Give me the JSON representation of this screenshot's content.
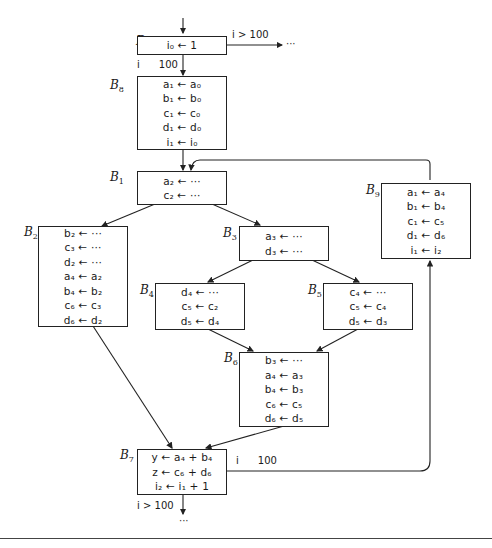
{
  "blocks": {
    "B0": {
      "label": "B",
      "sub": "0",
      "stmts": [
        "i₀ ← 1"
      ]
    },
    "B8": {
      "label": "B",
      "sub": "8",
      "stmts": [
        "a₁ ← a₀",
        "b₁ ← b₀",
        "c₁ ← c₀",
        "d₁ ← d₀",
        "i₁ ← i₀"
      ]
    },
    "B1": {
      "label": "B",
      "sub": "1",
      "stmts": [
        "a₂ ← ···",
        "c₂ ← ···"
      ]
    },
    "B2": {
      "label": "B",
      "sub": "2",
      "stmts": [
        "b₂ ← ···",
        "c₃ ← ···",
        "d₂ ← ···",
        "a₄ ← a₂",
        "b₄ ← b₂",
        "c₆ ← c₃",
        "d₆ ← d₂"
      ]
    },
    "B3": {
      "label": "B",
      "sub": "3",
      "stmts": [
        "a₃ ← ···",
        "d₃ ← ···"
      ]
    },
    "B4": {
      "label": "B",
      "sub": "4",
      "stmts": [
        "d₄ ← ···",
        "c₅ ← c₂",
        "d₅ ← d₄"
      ]
    },
    "B5": {
      "label": "B",
      "sub": "5",
      "stmts": [
        "c₄ ← ···",
        "c₅ ← c₄",
        "d₅ ← d₃"
      ]
    },
    "B6": {
      "label": "B",
      "sub": "6",
      "stmts": [
        "b₃ ← ···",
        "a₄ ← a₃",
        "b₄ ← b₃",
        "c₆ ← c₅",
        "d₆ ← d₅"
      ]
    },
    "B7": {
      "label": "B",
      "sub": "7",
      "stmts": [
        "y ← a₄ + b₄",
        "z ← c₆ + d₆",
        "i₂ ← i₁ + 1"
      ]
    },
    "B9": {
      "label": "B",
      "sub": "9",
      "stmts": [
        "a₁ ← a₄",
        "b₁ ← b₄",
        "c₁ ← c₅",
        "d₁ ← d₆",
        "i₁ ← i₂"
      ]
    }
  },
  "conditions": {
    "b0_exit": "i > 100",
    "b0_continue": "i      100",
    "b7_loop": "i      100",
    "b7_exit": "i > 100"
  },
  "ellipsis": {
    "b0_exit": "···",
    "b7_exit": "···"
  }
}
